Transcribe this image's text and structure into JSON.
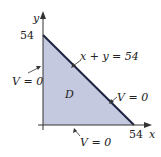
{
  "diagram": {
    "axes": {
      "x_label": "x",
      "y_label": "y",
      "x_tick": "54",
      "y_tick": "54"
    },
    "region": {
      "label": "D",
      "fill_color": "#c5c9df",
      "edge_color": "#1b2340"
    },
    "boundary_labels": {
      "hypotenuse": "x + y = 54",
      "hypotenuse_condition": "V = 0",
      "left_edge": "V = 0",
      "bottom_edge": "V = 0"
    }
  }
}
